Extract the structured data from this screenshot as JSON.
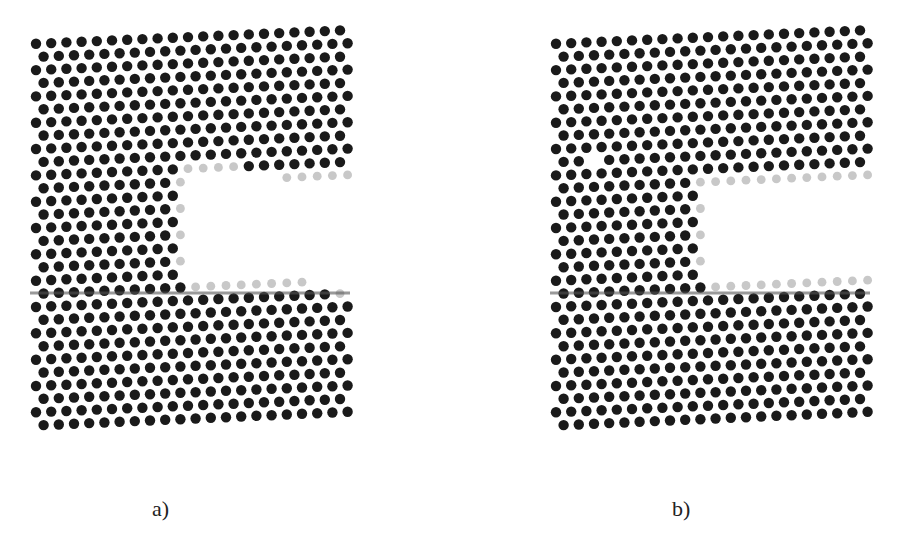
{
  "figure": {
    "panels": [
      {
        "id": "a",
        "caption": "a)",
        "origin_x": 30,
        "caption_x": 152,
        "notch": {
          "x_start": 185,
          "y_top": 178,
          "y_bottom": 282
        },
        "defects": []
      },
      {
        "id": "b",
        "caption": "b)",
        "origin_x": 550,
        "caption_x": 672,
        "notch": {
          "x_start": 705,
          "y_top": 182,
          "y_bottom": 278
        },
        "defects": [
          [
            597,
            157
          ],
          [
            665,
            187
          ]
        ]
      }
    ],
    "lattice": {
      "spacing": 15.2,
      "dot_radius": 5.2,
      "top_left_y": 44,
      "top_right_y": 30,
      "bottom_y": 420,
      "width": 320,
      "crack_y": 293,
      "colors": {
        "atom": "#1a1a1a",
        "surface_atom": "#c8c8c8",
        "background": "#ffffff"
      }
    }
  }
}
